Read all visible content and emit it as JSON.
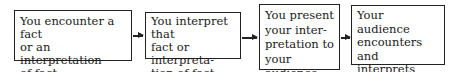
{
  "diagram": {
    "type": "flowchart",
    "steps": [
      {
        "text": "You encounter a fact\nor an interpretation\nof fact"
      },
      {
        "text": "You interpret that\nfact or interpreta-\ntion of fact"
      },
      {
        "text": "You present\nyour inter-\npretation to\nyour audience"
      },
      {
        "text": "Your audience\nencounters and\ninterprets your\npresentation"
      }
    ],
    "arrows": [
      {
        "from": 0,
        "to": 1
      },
      {
        "from": 1,
        "to": 2
      },
      {
        "from": 2,
        "to": 3
      }
    ]
  }
}
